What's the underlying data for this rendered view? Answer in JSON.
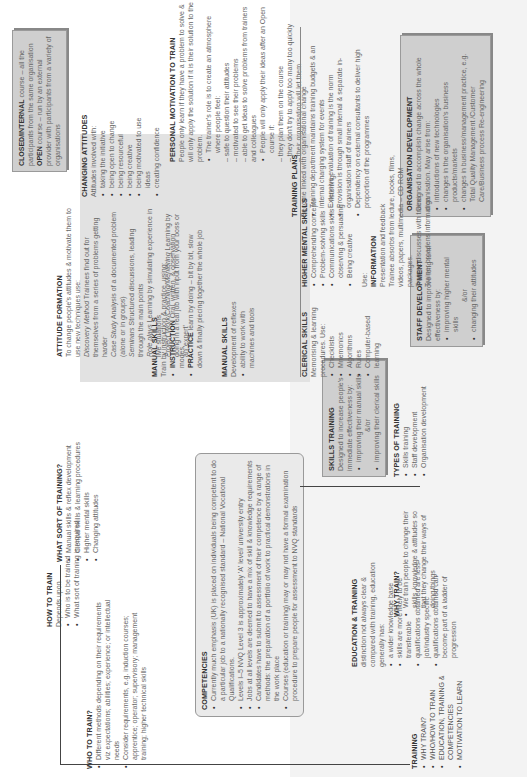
{
  "training": {
    "title": "TRAINING",
    "items": [
      "WHY TRAIN?",
      "WHO/HOW TO TRAIN",
      "EDUCATION, TRAINING & COMPETENCIES",
      "MOTIVATION TO LEARN"
    ]
  },
  "why_train": {
    "title": "WHY TRAIN?",
    "items": [
      "We train people to change their skills, knowledge & attitudes so that they change their ways of doing things"
    ]
  },
  "types_of_training": {
    "title": "TYPES OF TRAINING",
    "items": [
      "Skills training",
      "Staff development",
      "Organisation development"
    ]
  },
  "skills_training": {
    "title": "SKILLS TRAINING",
    "intro": "Designed to increase people's immediate effectiveness by:",
    "items": [
      "improving their manual skills",
      "improving their clerical skills"
    ],
    "andor": "&/or"
  },
  "staff_development": {
    "title": "STAFF DEVELOPMENT",
    "intro": "Designed to improve long term effectiveness by:",
    "items": [
      "improving higher mental skills",
      "changing their attitudes"
    ],
    "andor": "&/or"
  },
  "organisation_development": {
    "title": "ORGANISATION DEVELOPMENT",
    "intro": "Designed to accomplish change across the whole organisation. May arise from:",
    "items": [
      "introductions of new technologies",
      "changes in the organisation's business products/markets",
      "changes in business/management practice, e.g. Total Quality Management /Customer Care/Business process Re-engineering"
    ]
  },
  "training_plans": {
    "title": "TRAINING PLANS",
    "intro": "Become linked with organisational change",
    "items": [
      "Training department maintains training budgets & an internal charging system for events",
      "Extensive evaluation of training is the norm",
      "Provision is through small internal & separate in-organisation staff of trainers",
      "Dependency on external consultants to deliver high proportion of the programmes"
    ]
  },
  "personal_motivation": {
    "title": "PERSONAL MOTIVATION TO TRAIN",
    "intro": "People only learn if they have a problem to solve & will only apply the solution if it is their solution to the problem.",
    "item1": "The trainer's role is to create an atmosphere where people feel:",
    "dashes1": [
      "– safe to question their attitudes",
      "– motivated to see their problems",
      "– able to get ideas to solve problems from trainers and colleagues"
    ],
    "item2": "People will only apply their ideas after an Open course if:",
    "dashes2": [
      "– they plan them on the course",
      "– they don't try to apply too many too quickly",
      "– their organisation will let them"
    ]
  },
  "closed_open": {
    "closed_label": "CLOSED/INTERNAL",
    "closed_text": " course – all the participants from the same organisation",
    "open_label": "OPEN",
    "open_text": " course – run by an external provider with participants from a variety of organisations"
  },
  "clerical_skills": {
    "title": "CLERICAL SKILLS",
    "intro": "Memorising & learning procedures. Use:",
    "items": [
      "Checklists",
      "Mnemonics",
      "Algorithms",
      "Rules",
      "Computer-based learning"
    ]
  },
  "manual_skills_dev": {
    "title": "MANUAL SKILLS",
    "intro": "Development of reflexes",
    "items": [
      "ability to work with machines and tools"
    ]
  },
  "manual_skills_train": {
    "title": "MANUAL SKILLS",
    "intro": "Train by instruction & practice, using:",
    "instr_label": "INSTRUCTION",
    "instr_text": " Oral, written, & observation modes",
    "prac_label": "PRACTICE",
    "prac_text": " learn by doing – bit by bit, slow down & finally piecing together the whole job"
  },
  "higher_mental": {
    "title": "HIGHER MENTAL SKILLS",
    "items": [
      "Comprehending concepts",
      "Problem-solving skills",
      "Communications skills – listening, observing & persuading",
      "Being creative"
    ],
    "use": "Use:",
    "info_title": "INFORMATION",
    "info_lines": [
      "Presentation and feedback",
      "Trainee absorbs from lecture, books, films, videos, papers, multimedia – CD ROM packages.",
      "Trainee discusses with trainer",
      "Trainer broadens information"
    ]
  },
  "attitude_formation": {
    "title": "ATTITUDE FORMATION",
    "intro": "To change people's attitudes & motivate them to use new techniques use:",
    "lines": [
      {
        "label": "Discovery Method",
        "text": " Trainees find out for themselves from a series of problems getting harder"
      },
      {
        "label": "Case Study",
        "text": " Analysis of a documented problem (alone or in groups)"
      },
      {
        "label": "Seminars",
        "text": " Structured discussions, leading through the main points"
      },
      {
        "label": "Role plays",
        "text": " Learning by simulating experience in live situations"
      },
      {
        "label": "Project Work/Coaching/Mentoring",
        "text": " Learning by doing in a real job with input from your boss or an 'expert'"
      }
    ]
  },
  "changing_attitudes": {
    "title": "CHANGING ATTITUDES",
    "intro": "Attitudes involved with:",
    "items": [
      "taking the initiative",
      "being open to change",
      "being resourceful",
      "being creative",
      "being motivated to use ideas",
      "creating confidence"
    ]
  },
  "education_training": {
    "title": "EDUCATION & TRAINING",
    "intro": "distinction not always clear & compared with training, education generally has:",
    "items": [
      "a wider knowledge base",
      "skills are more likely to be transferable",
      "qualifications obtained are less job/industry specific",
      "qualifications obtained can become part of a ladder of progression"
    ]
  },
  "competencies": {
    "title": "COMPETENCIES",
    "items": [
      "Currently much emphasis (UK) is placed on individuals being competent to do a particular job to a nationally recognised standard – National Vocational Qualifications.",
      "Levels I–5 NVQ Level 3 is approximately 'A' level/ university entry",
      "Jobs at all levels are deemed to have a mix of skill & knowledge requirements",
      "Candidates have to submit to assessment of their competence by a range of methods: the preparation of a portfolio of work to practical demonstrations in the work place",
      "Courses (education or training) may or may not have a formal examination procedure to prepare people for assessment to NVQ standards"
    ]
  },
  "who_to_train": {
    "title": "WHO TO TRAIN?",
    "items": [
      "Different methods depending on their requirements viz expectations; abilities; experience; or intellectual needs",
      "Consider requirements, e.g. induction courses; apprentice; operator; supervisory; management training; higher technical skills"
    ]
  },
  "what_sort": {
    "title": "WHAT SORT OF TRAINING?",
    "items": [
      "Manual skills & reflex development",
      "Clerical skills & learning procedures",
      "Higher mental skills",
      "Changing attitudes"
    ]
  },
  "how_to_train": {
    "title": "HOW TO TRAIN",
    "intro": "Depends upon",
    "items": [
      "Who is to be trained",
      "What sort of training is required"
    ]
  }
}
